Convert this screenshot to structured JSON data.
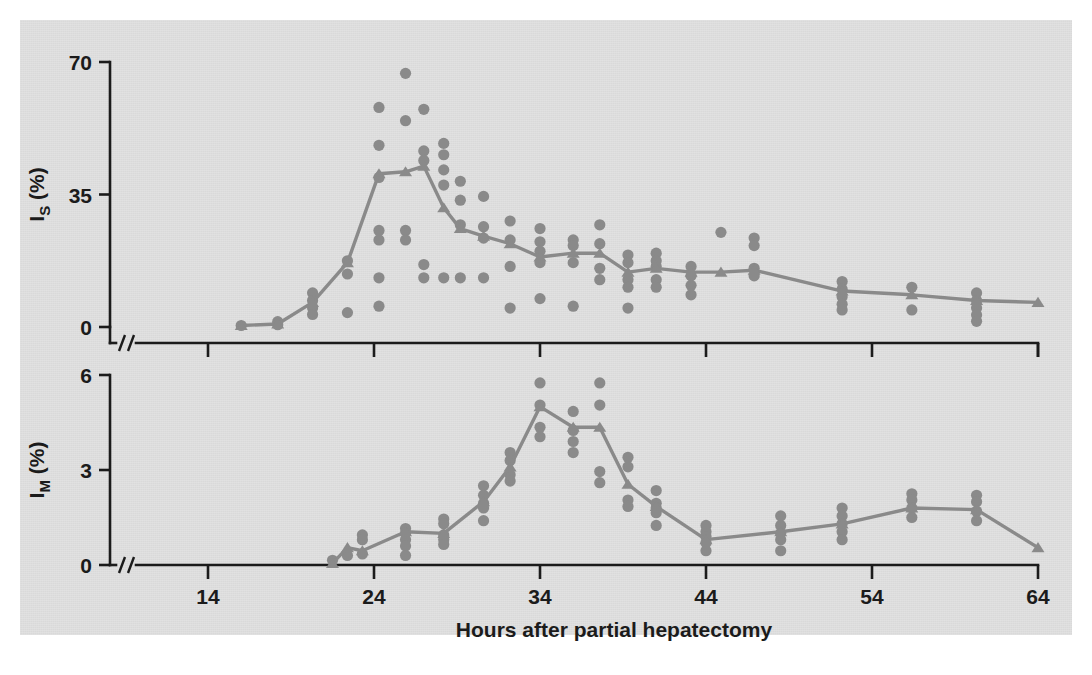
{
  "figure": {
    "background_color": "#d9d9d9",
    "page_color": "#ffffff",
    "ink_color": "#1b1b1b",
    "data_color": "#8a8a8a"
  },
  "xaxis": {
    "label": "Hours after partial hepatectomy",
    "ticks": [
      14,
      24,
      34,
      44,
      54,
      64
    ],
    "tick_labels": [
      "14",
      "24",
      "34",
      "44",
      "54",
      "64"
    ],
    "range": [
      11.5,
      64
    ],
    "axis_break": true
  },
  "panels": [
    {
      "id": "top",
      "ylabel_main": "I",
      "ylabel_sub": "S",
      "ylabel_unit": "(%)",
      "ylabel_full": "IS (%)",
      "yticks": [
        0,
        35,
        70
      ],
      "ytick_labels": [
        "0",
        "35",
        "70"
      ],
      "ylim": [
        0,
        70
      ],
      "axis_break": true
    },
    {
      "id": "bottom",
      "ylabel_main": "I",
      "ylabel_sub": "M",
      "ylabel_unit": "(%)",
      "ylabel_full": "IM (%)",
      "yticks": [
        0,
        3,
        6
      ],
      "ytick_labels": [
        "0",
        "3",
        "6"
      ],
      "ylim": [
        0,
        6
      ],
      "axis_break": true
    }
  ],
  "chart_data": [
    {
      "type": "scatter",
      "panel": "top",
      "title": "",
      "xlabel": "Hours after partial hepatectomy",
      "ylabel": "IS (%)",
      "xlim": [
        11.5,
        64
      ],
      "ylim": [
        0,
        70
      ],
      "grid": false,
      "legend": "none",
      "marker": "circle",
      "points": [
        {
          "x": 16.0,
          "y": 0.4
        },
        {
          "x": 18.2,
          "y": 1.4
        },
        {
          "x": 18.2,
          "y": 0.6
        },
        {
          "x": 20.3,
          "y": 9.0
        },
        {
          "x": 20.3,
          "y": 7.0
        },
        {
          "x": 20.3,
          "y": 5.0
        },
        {
          "x": 20.3,
          "y": 3.3
        },
        {
          "x": 22.4,
          "y": 17.5
        },
        {
          "x": 22.4,
          "y": 14.0
        },
        {
          "x": 22.4,
          "y": 3.8
        },
        {
          "x": 24.3,
          "y": 58.0
        },
        {
          "x": 24.3,
          "y": 48.0
        },
        {
          "x": 24.3,
          "y": 39.5
        },
        {
          "x": 24.3,
          "y": 25.5
        },
        {
          "x": 24.3,
          "y": 23.0
        },
        {
          "x": 24.3,
          "y": 13.0
        },
        {
          "x": 24.3,
          "y": 5.5
        },
        {
          "x": 25.9,
          "y": 67.0
        },
        {
          "x": 25.9,
          "y": 54.5
        },
        {
          "x": 25.9,
          "y": 25.5
        },
        {
          "x": 25.9,
          "y": 23.0
        },
        {
          "x": 27.0,
          "y": 57.5
        },
        {
          "x": 27.0,
          "y": 46.5
        },
        {
          "x": 27.0,
          "y": 44.0
        },
        {
          "x": 27.0,
          "y": 16.5
        },
        {
          "x": 27.0,
          "y": 13.0
        },
        {
          "x": 28.2,
          "y": 48.5
        },
        {
          "x": 28.2,
          "y": 45.5
        },
        {
          "x": 28.2,
          "y": 41.5
        },
        {
          "x": 28.2,
          "y": 37.5
        },
        {
          "x": 28.2,
          "y": 13.0
        },
        {
          "x": 29.2,
          "y": 38.5
        },
        {
          "x": 29.2,
          "y": 33.5
        },
        {
          "x": 29.2,
          "y": 27.0
        },
        {
          "x": 29.2,
          "y": 13.0
        },
        {
          "x": 30.6,
          "y": 34.5
        },
        {
          "x": 30.6,
          "y": 26.5
        },
        {
          "x": 30.6,
          "y": 23.5
        },
        {
          "x": 30.6,
          "y": 13.0
        },
        {
          "x": 32.2,
          "y": 28.0
        },
        {
          "x": 32.2,
          "y": 23.0
        },
        {
          "x": 32.2,
          "y": 16.0
        },
        {
          "x": 32.2,
          "y": 5.0
        },
        {
          "x": 34.0,
          "y": 26.0
        },
        {
          "x": 34.0,
          "y": 22.5
        },
        {
          "x": 34.0,
          "y": 20.0
        },
        {
          "x": 34.0,
          "y": 17.0
        },
        {
          "x": 34.0,
          "y": 7.5
        },
        {
          "x": 36.0,
          "y": 23.0
        },
        {
          "x": 36.0,
          "y": 21.5
        },
        {
          "x": 36.0,
          "y": 17.0
        },
        {
          "x": 36.0,
          "y": 5.5
        },
        {
          "x": 37.6,
          "y": 27.0
        },
        {
          "x": 37.6,
          "y": 22.0
        },
        {
          "x": 37.6,
          "y": 15.5
        },
        {
          "x": 37.6,
          "y": 12.5
        },
        {
          "x": 39.3,
          "y": 19.0
        },
        {
          "x": 39.3,
          "y": 17.0
        },
        {
          "x": 39.3,
          "y": 12.5
        },
        {
          "x": 39.3,
          "y": 10.5
        },
        {
          "x": 39.3,
          "y": 5.0
        },
        {
          "x": 41.0,
          "y": 19.5
        },
        {
          "x": 41.0,
          "y": 17.5
        },
        {
          "x": 41.0,
          "y": 16.0
        },
        {
          "x": 41.0,
          "y": 12.5
        },
        {
          "x": 41.0,
          "y": 10.5
        },
        {
          "x": 43.1,
          "y": 16.0
        },
        {
          "x": 43.1,
          "y": 13.5
        },
        {
          "x": 43.1,
          "y": 11.0
        },
        {
          "x": 43.1,
          "y": 8.5
        },
        {
          "x": 44.9,
          "y": 25.0
        },
        {
          "x": 46.9,
          "y": 23.5
        },
        {
          "x": 46.9,
          "y": 21.5
        },
        {
          "x": 46.9,
          "y": 15.5
        },
        {
          "x": 46.9,
          "y": 13.5
        },
        {
          "x": 52.2,
          "y": 12.0
        },
        {
          "x": 52.2,
          "y": 10.0
        },
        {
          "x": 52.2,
          "y": 8.0
        },
        {
          "x": 52.2,
          "y": 6.0
        },
        {
          "x": 52.2,
          "y": 4.5
        },
        {
          "x": 56.4,
          "y": 10.5
        },
        {
          "x": 56.4,
          "y": 4.5
        },
        {
          "x": 60.3,
          "y": 9.0
        },
        {
          "x": 60.3,
          "y": 7.0
        },
        {
          "x": 60.3,
          "y": 5.0
        },
        {
          "x": 60.3,
          "y": 3.2
        },
        {
          "x": 60.3,
          "y": 1.5
        }
      ],
      "mean_series": {
        "name": "mean",
        "marker": "triangle",
        "x": [
          16.0,
          18.2,
          20.3,
          22.4,
          24.3,
          25.9,
          27.0,
          28.2,
          29.2,
          30.6,
          32.2,
          34.0,
          36.0,
          37.6,
          39.3,
          41.0,
          43.1,
          44.9,
          46.9,
          52.2,
          56.4,
          60.3,
          64.0
        ],
        "y": [
          0.4,
          0.8,
          6.5,
          17.0,
          40.5,
          41.0,
          42.5,
          31.5,
          26.0,
          24.0,
          22.0,
          18.5,
          19.5,
          19.5,
          14.5,
          15.5,
          14.5,
          14.5,
          15.0,
          9.5,
          8.5,
          7.0,
          6.5
        ]
      }
    },
    {
      "type": "scatter",
      "panel": "bottom",
      "title": "",
      "xlabel": "Hours after partial hepatectomy",
      "ylabel": "IM (%)",
      "xlim": [
        11.5,
        64
      ],
      "ylim": [
        0,
        6
      ],
      "grid": false,
      "legend": "none",
      "marker": "circle",
      "points": [
        {
          "x": 21.5,
          "y": 0.15
        },
        {
          "x": 22.4,
          "y": 0.3
        },
        {
          "x": 23.3,
          "y": 0.95
        },
        {
          "x": 23.3,
          "y": 0.8
        },
        {
          "x": 23.3,
          "y": 0.35
        },
        {
          "x": 25.9,
          "y": 1.15
        },
        {
          "x": 25.9,
          "y": 1.0
        },
        {
          "x": 25.9,
          "y": 0.8
        },
        {
          "x": 25.9,
          "y": 0.6
        },
        {
          "x": 25.9,
          "y": 0.3
        },
        {
          "x": 28.2,
          "y": 1.45
        },
        {
          "x": 28.2,
          "y": 1.3
        },
        {
          "x": 28.2,
          "y": 0.95
        },
        {
          "x": 28.2,
          "y": 0.8
        },
        {
          "x": 28.2,
          "y": 0.65
        },
        {
          "x": 30.6,
          "y": 2.5
        },
        {
          "x": 30.6,
          "y": 2.2
        },
        {
          "x": 30.6,
          "y": 1.95
        },
        {
          "x": 30.6,
          "y": 1.8
        },
        {
          "x": 30.6,
          "y": 1.4
        },
        {
          "x": 32.2,
          "y": 3.55
        },
        {
          "x": 32.2,
          "y": 3.3
        },
        {
          "x": 32.2,
          "y": 2.85
        },
        {
          "x": 32.2,
          "y": 2.65
        },
        {
          "x": 34.0,
          "y": 5.75
        },
        {
          "x": 34.0,
          "y": 5.05
        },
        {
          "x": 34.0,
          "y": 4.35
        },
        {
          "x": 34.0,
          "y": 4.05
        },
        {
          "x": 36.0,
          "y": 4.85
        },
        {
          "x": 36.0,
          "y": 4.25
        },
        {
          "x": 36.0,
          "y": 3.9
        },
        {
          "x": 36.0,
          "y": 3.55
        },
        {
          "x": 37.6,
          "y": 5.75
        },
        {
          "x": 37.6,
          "y": 5.05
        },
        {
          "x": 37.6,
          "y": 2.95
        },
        {
          "x": 37.6,
          "y": 2.6
        },
        {
          "x": 39.3,
          "y": 3.4
        },
        {
          "x": 39.3,
          "y": 3.1
        },
        {
          "x": 39.3,
          "y": 2.05
        },
        {
          "x": 39.3,
          "y": 1.85
        },
        {
          "x": 41.0,
          "y": 2.35
        },
        {
          "x": 41.0,
          "y": 1.95
        },
        {
          "x": 41.0,
          "y": 1.8
        },
        {
          "x": 41.0,
          "y": 1.65
        },
        {
          "x": 41.0,
          "y": 1.25
        },
        {
          "x": 44.0,
          "y": 1.25
        },
        {
          "x": 44.0,
          "y": 1.05
        },
        {
          "x": 44.0,
          "y": 0.9
        },
        {
          "x": 44.0,
          "y": 0.7
        },
        {
          "x": 44.0,
          "y": 0.45
        },
        {
          "x": 48.5,
          "y": 1.55
        },
        {
          "x": 48.5,
          "y": 1.25
        },
        {
          "x": 48.5,
          "y": 1.0
        },
        {
          "x": 48.5,
          "y": 0.8
        },
        {
          "x": 48.5,
          "y": 0.45
        },
        {
          "x": 52.2,
          "y": 1.8
        },
        {
          "x": 52.2,
          "y": 1.55
        },
        {
          "x": 52.2,
          "y": 1.3
        },
        {
          "x": 52.2,
          "y": 1.05
        },
        {
          "x": 52.2,
          "y": 0.8
        },
        {
          "x": 56.4,
          "y": 2.25
        },
        {
          "x": 56.4,
          "y": 2.05
        },
        {
          "x": 56.4,
          "y": 1.8
        },
        {
          "x": 56.4,
          "y": 1.5
        },
        {
          "x": 60.3,
          "y": 2.2
        },
        {
          "x": 60.3,
          "y": 2.0
        },
        {
          "x": 60.3,
          "y": 1.7
        },
        {
          "x": 60.3,
          "y": 1.4
        }
      ],
      "mean_series": {
        "name": "mean",
        "marker": "triangle",
        "x": [
          21.5,
          22.4,
          23.3,
          25.9,
          28.2,
          30.6,
          32.2,
          34.0,
          36.0,
          37.6,
          39.3,
          41.0,
          44.0,
          48.5,
          52.2,
          56.4,
          60.3,
          64.0
        ],
        "y": [
          0.05,
          0.55,
          0.45,
          1.05,
          1.0,
          2.0,
          3.1,
          5.0,
          4.35,
          4.35,
          2.55,
          1.85,
          0.8,
          1.05,
          1.3,
          1.8,
          1.75,
          0.55
        ]
      }
    }
  ]
}
